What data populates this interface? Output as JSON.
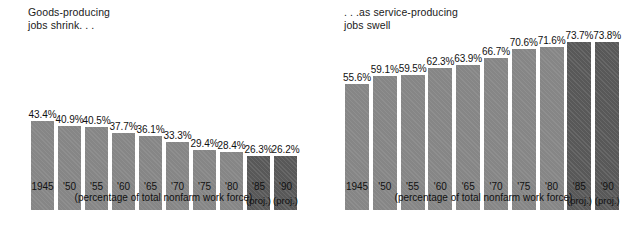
{
  "chart_data": [
    {
      "type": "bar",
      "id": "goods-producing",
      "title": "Goods-producing\njobs shrink. . .",
      "caption": "(percentage of total nonfarm work force)",
      "xlabel": "",
      "ylabel": "",
      "ylim": [
        0,
        80
      ],
      "grid": false,
      "legend": "none",
      "categories": [
        "1945",
        "'50",
        "'55",
        "'60",
        "'65",
        "'70",
        "'75",
        "'80",
        "'85",
        "'90"
      ],
      "values": [
        43.4,
        40.9,
        40.5,
        37.7,
        36.1,
        33.3,
        29.4,
        28.4,
        26.3,
        26.2
      ],
      "value_labels": [
        "43.4%",
        "40.9%",
        "40.5%",
        "37.7%",
        "36.1%",
        "33.3%",
        "29.4%",
        "28.4%",
        "26.3%",
        "26.2%"
      ],
      "projected": [
        false,
        false,
        false,
        false,
        false,
        false,
        false,
        false,
        true,
        true
      ],
      "projection_note": "(proj.)",
      "bar_color": "#8a8a8a",
      "projected_bar_color": "#5d5d5d"
    },
    {
      "type": "bar",
      "id": "service-producing",
      "title": ". . .as service-producing\njobs swell",
      "caption": "(percentage of total nonfarm work force)",
      "xlabel": "",
      "ylabel": "",
      "ylim": [
        0,
        80
      ],
      "grid": false,
      "legend": "none",
      "categories": [
        "1945",
        "'50",
        "'55",
        "'60",
        "'65",
        "'70",
        "'75",
        "'80",
        "'85",
        "'90"
      ],
      "values": [
        55.6,
        59.1,
        59.5,
        62.3,
        63.9,
        66.7,
        70.6,
        71.6,
        73.7,
        73.8
      ],
      "value_labels": [
        "55.6%",
        "59.1%",
        "59.5%",
        "62.3%",
        "63.9%",
        "66.7%",
        "70.6%",
        "71.6%",
        "73.7%",
        "73.8%"
      ],
      "projected": [
        false,
        false,
        false,
        false,
        false,
        false,
        false,
        false,
        true,
        true
      ],
      "projection_note": "(proj.)",
      "bar_color": "#8a8a8a",
      "projected_bar_color": "#5d5d5d"
    }
  ]
}
